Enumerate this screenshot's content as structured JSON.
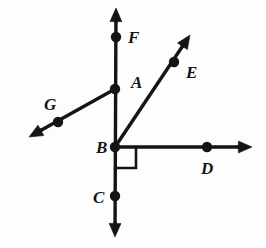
{
  "figure": {
    "kind": "geometry-diagram",
    "background_color": "#fdfdfd",
    "stroke_color": "#141414",
    "canvas": {
      "width": 266,
      "height": 248
    }
  },
  "points": [
    {
      "id": "F",
      "label": "F",
      "dot_x": 116,
      "dot_y": 37,
      "label_x": 128,
      "label_y": 43
    },
    {
      "id": "A",
      "label": "A",
      "dot_x": 115,
      "dot_y": 89,
      "label_x": 131,
      "label_y": 88
    },
    {
      "id": "E",
      "label": "E",
      "dot_x": 174,
      "dot_y": 62,
      "label_x": 186,
      "label_y": 78
    },
    {
      "id": "G",
      "label": "G",
      "dot_x": 58,
      "dot_y": 122,
      "label_x": 44,
      "label_y": 110
    },
    {
      "id": "B",
      "label": "B",
      "dot_x": 115,
      "dot_y": 147,
      "label_x": 96,
      "label_y": 153
    },
    {
      "id": "D",
      "label": "D",
      "dot_x": 207,
      "dot_y": 147,
      "label_x": 201,
      "label_y": 174
    },
    {
      "id": "C",
      "label": "C",
      "dot_x": 115,
      "dot_y": 196,
      "label_x": 93,
      "label_y": 203
    }
  ],
  "dot_radius": 5.2,
  "lines": [
    {
      "id": "line-FC",
      "name": "vertical-line-through-F-A-B-C",
      "x1": 116,
      "y1": 8,
      "x2": 115,
      "y2": 237,
      "arrow_start": true,
      "arrow_end": true,
      "stroke_width": 3.4
    },
    {
      "id": "ray-BD",
      "name": "horizontal-ray-B-to-D",
      "x1": 115,
      "y1": 147,
      "x2": 252,
      "y2": 147,
      "arrow_start": false,
      "arrow_end": true,
      "stroke_width": 3.4
    },
    {
      "id": "ray-BE",
      "name": "ray-B-through-E",
      "x1": 115,
      "y1": 147,
      "x2": 190,
      "y2": 35,
      "arrow_start": false,
      "arrow_end": true,
      "stroke_width": 3.4
    },
    {
      "id": "ray-AG",
      "name": "ray-A-through-G",
      "x1": 115,
      "y1": 89,
      "x2": 29,
      "y2": 137,
      "arrow_start": false,
      "arrow_end": true,
      "stroke_width": 3.4
    }
  ],
  "right_angle_mark": {
    "name": "right-angle-at-B",
    "vertex_x": 115,
    "vertex_y": 147,
    "size": 21,
    "direction_x": 1,
    "direction_y": 1,
    "stroke_width": 2.6
  }
}
